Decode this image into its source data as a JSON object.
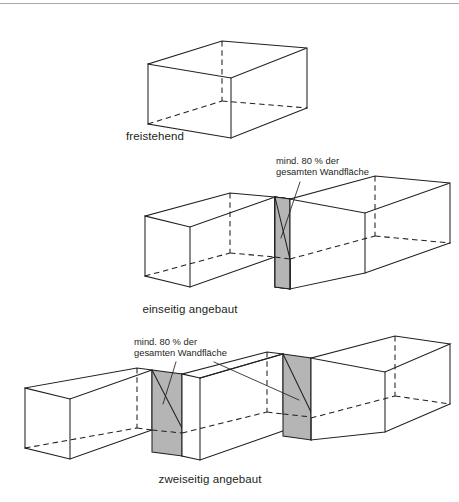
{
  "figure": {
    "title_visible": false,
    "background_color": "#ffffff",
    "line_color": "#231f20",
    "shade_color": "#b5b5b5",
    "rule_color": "#a7a9ac"
  },
  "top_rule": {
    "present": true
  },
  "diagrams": [
    {
      "id": "freestanding",
      "caption": "freistehend",
      "boxes": 1,
      "shaded_walls": 0,
      "annotation": null
    },
    {
      "id": "one-side-attached",
      "caption": "einseitig angebaut",
      "boxes": 2,
      "shaded_walls": 1,
      "annotation": {
        "line1": "mind. 80 % der",
        "line2": "gesamten Wandfläche"
      }
    },
    {
      "id": "two-sides-attached",
      "caption": "zweiseitig angebaut",
      "boxes": 3,
      "shaded_walls": 2,
      "annotation": {
        "line1": "mind. 80 % der",
        "line2": "gesamten Wandfläche"
      }
    }
  ]
}
